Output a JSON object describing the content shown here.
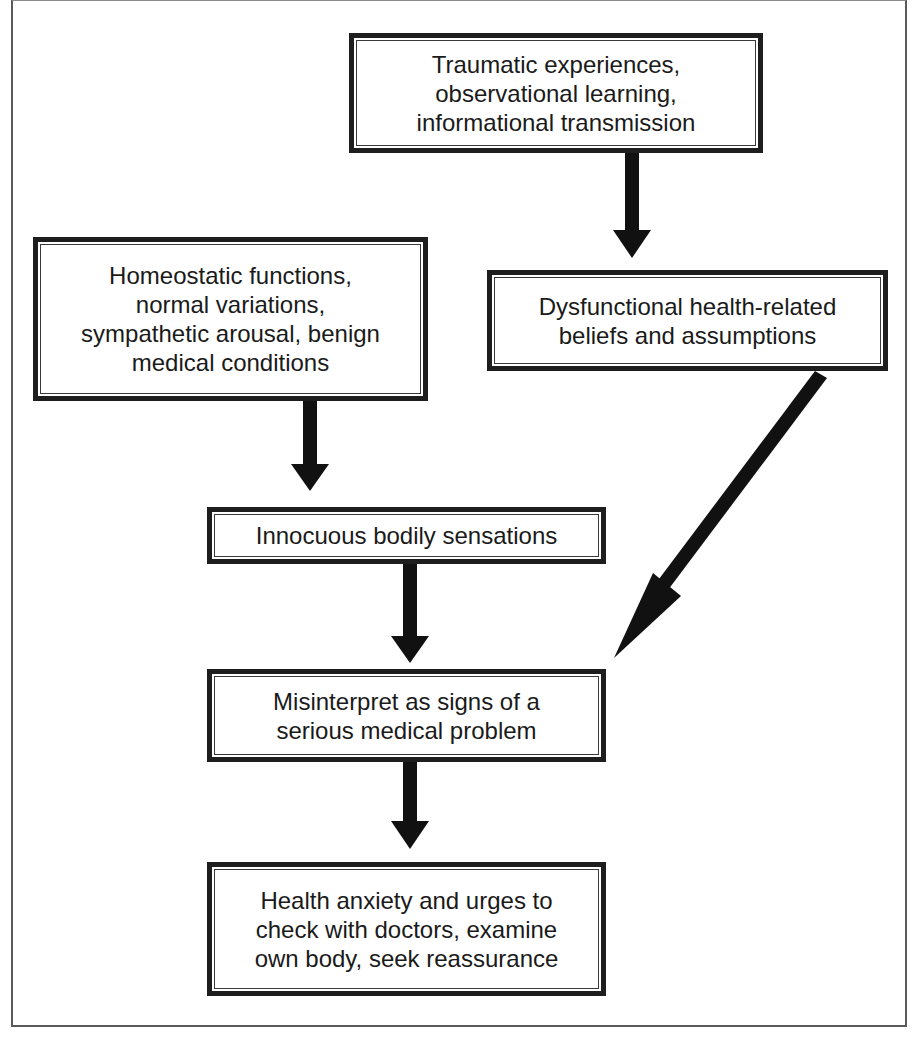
{
  "diagram": {
    "nodes": [
      {
        "id": "traumatic",
        "label": "Traumatic experiences,\nobservational learning,\ninformational transmission"
      },
      {
        "id": "homeostatic",
        "label": "Homeostatic functions,\nnormal variations,\nsympathetic arousal, benign\nmedical conditions"
      },
      {
        "id": "dysfunctional",
        "label": "Dysfunctional health-related\nbeliefs and assumptions"
      },
      {
        "id": "innocuous",
        "label": "Innocuous bodily sensations"
      },
      {
        "id": "misinterpret",
        "label": "Misinterpret as signs of a\nserious medical problem"
      },
      {
        "id": "health_anxiety",
        "label": "Health anxiety and urges to\ncheck with doctors, examine\nown body, seek reassurance"
      }
    ],
    "edges": [
      {
        "from": "traumatic",
        "to": "dysfunctional"
      },
      {
        "from": "homeostatic",
        "to": "innocuous"
      },
      {
        "from": "dysfunctional",
        "to": "misinterpret"
      },
      {
        "from": "innocuous",
        "to": "misinterpret"
      },
      {
        "from": "misinterpret",
        "to": "health_anxiety"
      }
    ],
    "colors": {
      "border": "#1e1e1e",
      "arrow": "#111111",
      "text": "#1a1a1a",
      "background": "#ffffff"
    }
  }
}
